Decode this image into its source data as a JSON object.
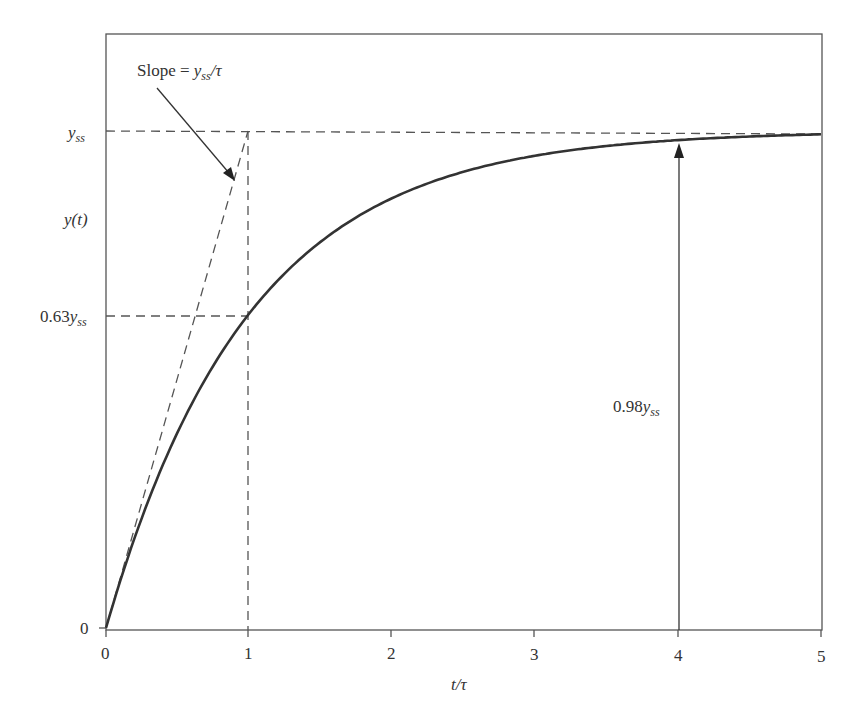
{
  "chart_data": {
    "type": "line",
    "title": "",
    "xlabel": "t/τ",
    "ylabel": "y(t)",
    "xlim": [
      0,
      5
    ],
    "ylim": [
      0,
      1
    ],
    "x_ticks": [
      "0",
      "1",
      "2",
      "3",
      "4",
      "5"
    ],
    "y_ticks": [
      "0",
      "0.63y_ss",
      "y_ss"
    ],
    "grid": false,
    "legend": null,
    "series": [
      {
        "name": "y(t) = y_ss (1 - e^(-t/τ))",
        "x": [
          0,
          0.25,
          0.5,
          0.75,
          1,
          1.5,
          2,
          2.5,
          3,
          3.5,
          4,
          4.5,
          5
        ],
        "y": [
          0,
          0.221,
          0.393,
          0.528,
          0.632,
          0.777,
          0.865,
          0.918,
          0.95,
          0.97,
          0.982,
          0.989,
          0.993
        ],
        "style": "solid"
      },
      {
        "name": "Initial slope tangent",
        "x": [
          0,
          1
        ],
        "y": [
          0,
          1
        ],
        "style": "dashed"
      }
    ],
    "reference_lines": [
      {
        "type": "horizontal",
        "y": 1.0,
        "label": "y_ss",
        "style": "dashed"
      },
      {
        "type": "horizontal",
        "y": 0.63,
        "x_range": [
          0,
          1
        ],
        "label": "0.63y_ss",
        "style": "dashed"
      },
      {
        "type": "vertical",
        "x": 1,
        "y_range": [
          0,
          1
        ],
        "style": "dashed"
      }
    ],
    "annotations": [
      {
        "text": "Slope = y_ss/τ",
        "arrow_to": [
          0.9,
          0.9
        ]
      },
      {
        "text": "0.98y_ss",
        "arrow": "vertical from 0 to 0.98 at x=4"
      }
    ]
  },
  "labels": {
    "slope_main": "Slope = ",
    "slope_y": "y",
    "slope_sub": "ss",
    "slope_tail": "/τ",
    "yss_y": "y",
    "yss_sub": "ss",
    "yt": "y(t)",
    "y063_num": "0.63",
    "y063_y": "y",
    "y063_sub": "ss",
    "y0": "0",
    "y098_num": "0.98",
    "y098_y": "y",
    "y098_sub": "ss",
    "xlabel": "t/τ",
    "xticks": [
      "0",
      "1",
      "2",
      "3",
      "4",
      "5"
    ]
  }
}
